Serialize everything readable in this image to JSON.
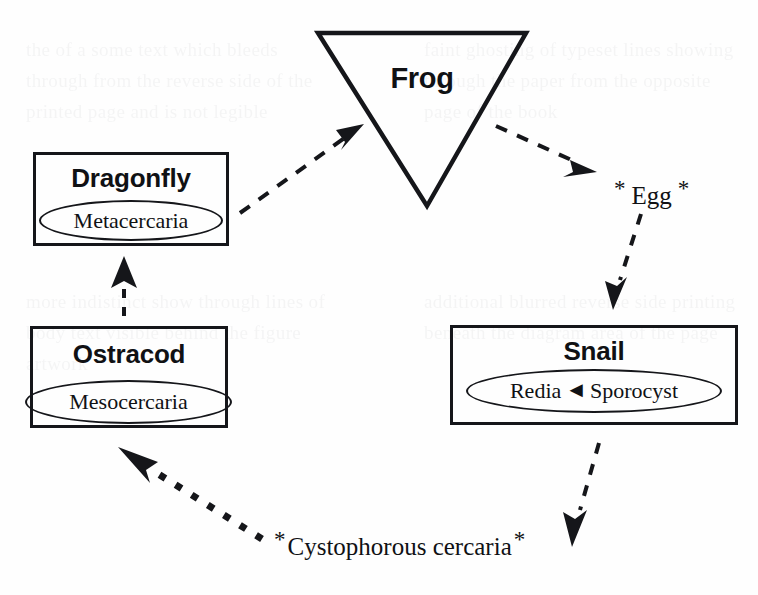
{
  "diagram": {
    "background_color": "#fefefe",
    "ink_color": "#15161a"
  },
  "hosts": {
    "frog": {
      "label": "Frog",
      "shape": "inverted-triangle"
    },
    "dragonfly": {
      "label": "Dragonfly",
      "shape": "rectangle",
      "stage": "Metacercaria"
    },
    "ostracod": {
      "label": "Ostracod",
      "shape": "rectangle",
      "stage": "Mesocercaria"
    },
    "snail": {
      "label": "Snail",
      "shape": "rectangle",
      "stage_left": "Redia",
      "stage_right": "Sporocyst",
      "stage_arrow": "◄"
    }
  },
  "free_stages": {
    "egg": {
      "label": "Egg",
      "asterisk": "*"
    },
    "cercaria": {
      "label": "Cystophorous cercaria",
      "asterisk": "*"
    }
  },
  "transitions": [
    {
      "id": "dragonfly-to-frog",
      "from": "Dragonfly",
      "to": "Frog",
      "style": "dashed"
    },
    {
      "id": "frog-to-egg",
      "from": "Frog",
      "to": "Egg",
      "style": "dashed"
    },
    {
      "id": "egg-to-snail",
      "from": "Egg",
      "to": "Snail",
      "style": "dashed"
    },
    {
      "id": "snail-to-cercaria",
      "from": "Snail",
      "to": "Cystophorous cercaria",
      "style": "dashed"
    },
    {
      "id": "cercaria-to-ostracod",
      "from": "Cystophorous cercaria",
      "to": "Ostracod",
      "style": "dotted-thick"
    },
    {
      "id": "ostracod-to-dragonfly",
      "from": "Ostracod",
      "to": "Dragonfly",
      "style": "dashed"
    }
  ],
  "ghost_text": {
    "left_top": "the of a some text which bleeds through from the reverse side of the printed page and is not legible",
    "right_top": "faint ghosting of typeset lines showing through the paper from the opposite page of the book",
    "left_bottom": "more indistinct show through lines of body text visible behind the figure artwork",
    "right_bottom": "additional blurred reverse side printing beneath the diagram area of the page"
  }
}
